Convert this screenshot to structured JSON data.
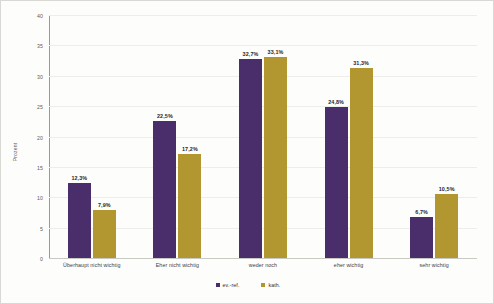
{
  "chart_data": {
    "type": "bar",
    "title": "",
    "subtitle": "",
    "xlabel": "",
    "ylabel": "Prozent",
    "ylim": [
      0,
      40
    ],
    "ytick_step": 5,
    "yticks": [
      "0",
      "5",
      "10",
      "15",
      "20",
      "25",
      "30",
      "35",
      "40"
    ],
    "grid": true,
    "legend_position": "bottom-center",
    "value_label_suffix": "%",
    "decimal_separator": ",",
    "categories": [
      "Überhaupt nicht wichtig",
      "Eher nicht wichtig",
      "weder noch",
      "eher wichtig",
      "sehr wichtig"
    ],
    "series": [
      {
        "name": "ev.-ref.",
        "color": "#4a2d6b",
        "values": [
          12.3,
          22.5,
          32.7,
          24.8,
          6.7
        ],
        "labels": [
          "12,3%",
          "22,5%",
          "32,7%",
          "24,8%",
          "6,7%"
        ]
      },
      {
        "name": "kath.",
        "color": "#b2962f",
        "values": [
          7.9,
          17.2,
          33.1,
          31.3,
          10.5
        ],
        "labels": [
          "7,9%",
          "17,2%",
          "33,1%",
          "31,3%",
          "10,5%"
        ]
      }
    ]
  },
  "colors": {
    "series_a": "#4a2d6b",
    "series_b": "#b2962f",
    "grid": "#ededea",
    "axis": "#9a9a95",
    "background": "#fdfdfc",
    "text": "#3b3b3b"
  }
}
